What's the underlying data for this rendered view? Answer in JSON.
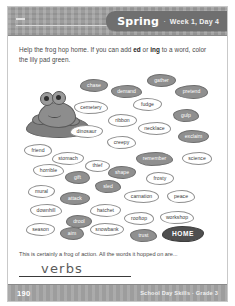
{
  "header": {
    "name_line_placeholder": "",
    "banner": {
      "season": "Spring",
      "separator": "·",
      "week_day": "Week 1, Day 4"
    }
  },
  "instructions": {
    "part1": "Help the frog hop home. If you can add ",
    "bold1": "ed",
    "mid": " or ",
    "bold2": "ing",
    "part2": " to a word, color the lily pad green."
  },
  "pond": {
    "frog_label": "frog-on-lily-pad",
    "pads": [
      {
        "word": "chase",
        "shaded": true,
        "x": 68,
        "y": 11,
        "w": 28,
        "h": 13,
        "shape": "b1"
      },
      {
        "word": "demand",
        "shaded": true,
        "x": 99,
        "y": 17,
        "w": 31,
        "h": 13,
        "shape": "b2"
      },
      {
        "word": "gather",
        "shaded": true,
        "x": 135,
        "y": 6,
        "w": 29,
        "h": 13,
        "shape": "b3"
      },
      {
        "word": "pretend",
        "shaded": true,
        "x": 163,
        "y": 17,
        "w": 33,
        "h": 14,
        "shape": "b4"
      },
      {
        "word": "cemetery",
        "shaded": false,
        "x": 62,
        "y": 33,
        "w": 34,
        "h": 13,
        "shape": "b2"
      },
      {
        "word": "fudge",
        "shaded": false,
        "x": 121,
        "y": 30,
        "w": 29,
        "h": 13,
        "shape": "b1"
      },
      {
        "word": "ribbon",
        "shaded": false,
        "x": 96,
        "y": 46,
        "w": 29,
        "h": 13,
        "shape": "b3"
      },
      {
        "word": "gulp",
        "shaded": true,
        "x": 161,
        "y": 41,
        "w": 26,
        "h": 13,
        "shape": "b2"
      },
      {
        "word": "necklace",
        "shaded": false,
        "x": 126,
        "y": 54,
        "w": 33,
        "h": 13,
        "shape": "b4"
      },
      {
        "word": "dinosaur",
        "shaded": false,
        "x": 58,
        "y": 57,
        "w": 33,
        "h": 13,
        "shape": "b1"
      },
      {
        "word": "exclaim",
        "shaded": true,
        "x": 166,
        "y": 62,
        "w": 31,
        "h": 13,
        "shape": "b3"
      },
      {
        "word": "creepy",
        "shaded": false,
        "x": 95,
        "y": 68,
        "w": 29,
        "h": 13,
        "shape": "b2"
      },
      {
        "word": "friend",
        "shaded": false,
        "x": 12,
        "y": 76,
        "w": 28,
        "h": 13,
        "shape": "b4"
      },
      {
        "word": "stomach",
        "shaded": false,
        "x": 40,
        "y": 84,
        "w": 32,
        "h": 13,
        "shape": "b1"
      },
      {
        "word": "thief",
        "shaded": false,
        "x": 73,
        "y": 92,
        "w": 25,
        "h": 12,
        "shape": "b3"
      },
      {
        "word": "remember",
        "shaded": true,
        "x": 124,
        "y": 84,
        "w": 37,
        "h": 14,
        "shape": "b2"
      },
      {
        "word": "science",
        "shaded": false,
        "x": 170,
        "y": 84,
        "w": 30,
        "h": 13,
        "shape": "b4"
      },
      {
        "word": "horrible",
        "shaded": false,
        "x": 21,
        "y": 96,
        "w": 31,
        "h": 13,
        "shape": "b2"
      },
      {
        "word": "shape",
        "shaded": true,
        "x": 96,
        "y": 98,
        "w": 28,
        "h": 13,
        "shape": "b1"
      },
      {
        "word": "frosty",
        "shaded": false,
        "x": 134,
        "y": 104,
        "w": 28,
        "h": 13,
        "shape": "b3"
      },
      {
        "word": "gift",
        "shaded": true,
        "x": 53,
        "y": 103,
        "w": 25,
        "h": 13,
        "shape": "b4"
      },
      {
        "word": "sled",
        "shaded": true,
        "x": 83,
        "y": 112,
        "w": 26,
        "h": 13,
        "shape": "b2"
      },
      {
        "word": "mural",
        "shaded": false,
        "x": 16,
        "y": 117,
        "w": 27,
        "h": 13,
        "shape": "b1"
      },
      {
        "word": "attack",
        "shaded": true,
        "x": 48,
        "y": 124,
        "w": 30,
        "h": 13,
        "shape": "b3"
      },
      {
        "word": "carnation",
        "shaded": false,
        "x": 112,
        "y": 122,
        "w": 35,
        "h": 13,
        "shape": "b4"
      },
      {
        "word": "peace",
        "shaded": false,
        "x": 155,
        "y": 122,
        "w": 28,
        "h": 13,
        "shape": "b2"
      },
      {
        "word": "downhill",
        "shaded": false,
        "x": 18,
        "y": 136,
        "w": 32,
        "h": 13,
        "shape": "b2"
      },
      {
        "word": "hatchet",
        "shaded": false,
        "x": 78,
        "y": 136,
        "w": 31,
        "h": 13,
        "shape": "b1"
      },
      {
        "word": "drool",
        "shaded": true,
        "x": 54,
        "y": 147,
        "w": 26,
        "h": 13,
        "shape": "b3"
      },
      {
        "word": "rooftop",
        "shaded": false,
        "x": 112,
        "y": 144,
        "w": 30,
        "h": 13,
        "shape": "b4"
      },
      {
        "word": "workshop",
        "shaded": false,
        "x": 148,
        "y": 143,
        "w": 34,
        "h": 13,
        "shape": "b2"
      },
      {
        "word": "season",
        "shaded": false,
        "x": 14,
        "y": 155,
        "w": 29,
        "h": 13,
        "shape": "b1"
      },
      {
        "word": "aim",
        "shaded": true,
        "x": 48,
        "y": 159,
        "w": 24,
        "h": 13,
        "shape": "b4"
      },
      {
        "word": "snowbank",
        "shaded": false,
        "x": 78,
        "y": 155,
        "w": 34,
        "h": 13,
        "shape": "b3"
      },
      {
        "word": "trust",
        "shaded": true,
        "x": 118,
        "y": 161,
        "w": 27,
        "h": 13,
        "shape": "b2"
      },
      {
        "word": "HOME",
        "shaded": false,
        "home": true,
        "x": 150,
        "y": 158,
        "w": 42,
        "h": 16,
        "shape": "b1"
      }
    ]
  },
  "answer": {
    "question": "This is certainly a frog of action. All the words it hopped on are...",
    "written": "verbs"
  },
  "footer": {
    "page_number": "190",
    "credit": "School Day Skills · Grade 3"
  }
}
